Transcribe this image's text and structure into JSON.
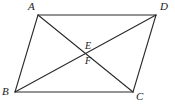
{
  "figure": {
    "kind": "geometry-diagram",
    "shape_name": "parallelogram",
    "background_color": "#ffffff",
    "stroke_color": "#2b2b2b",
    "label_color": "#1a1a1a",
    "stroke_width": 1,
    "canvas": {
      "width": 175,
      "height": 107
    }
  },
  "vertices": [
    {
      "id": "A",
      "label": "A",
      "x": 38,
      "y": 15,
      "label_x": 28,
      "label_y": 1
    },
    {
      "id": "D",
      "label": "D",
      "x": 156,
      "y": 15,
      "label_x": 160,
      "label_y": 1
    },
    {
      "id": "B",
      "label": "B",
      "x": 15,
      "y": 92,
      "label_x": 2,
      "label_y": 86
    },
    {
      "id": "C",
      "label": "C",
      "x": 133,
      "y": 92,
      "label_x": 136,
      "label_y": 91
    }
  ],
  "interior_points": [
    {
      "id": "E",
      "label": "E",
      "x": 86,
      "y": 52,
      "label_x": 85,
      "label_y": 41
    },
    {
      "id": "F",
      "label": "F",
      "x": 86,
      "y": 57,
      "label_x": 85,
      "label_y": 56
    }
  ],
  "edges": [
    {
      "id": "AD",
      "from": "A",
      "to": "D",
      "x1": 38,
      "y1": 15,
      "x2": 156,
      "y2": 15
    },
    {
      "id": "AB",
      "from": "A",
      "to": "B",
      "x1": 38,
      "y1": 15,
      "x2": 15,
      "y2": 92
    },
    {
      "id": "BC",
      "from": "B",
      "to": "C",
      "x1": 15,
      "y1": 92,
      "x2": 133,
      "y2": 92
    },
    {
      "id": "DC",
      "from": "D",
      "to": "C",
      "x1": 156,
      "y1": 15,
      "x2": 133,
      "y2": 92
    }
  ],
  "diagonals": [
    {
      "id": "AC",
      "from": "A",
      "to": "C",
      "x1": 38,
      "y1": 15,
      "x2": 133,
      "y2": 92
    },
    {
      "id": "BD",
      "from": "B",
      "to": "D",
      "x1": 15,
      "y1": 92,
      "x2": 156,
      "y2": 15
    }
  ]
}
